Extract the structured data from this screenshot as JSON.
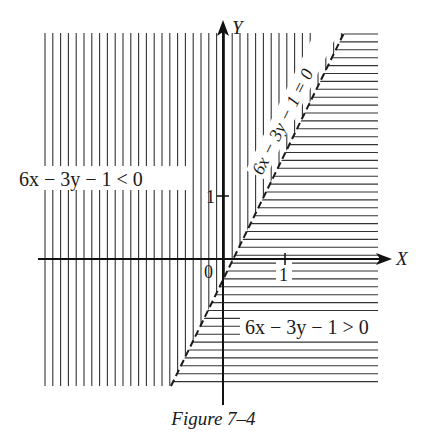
{
  "figure": {
    "caption": "Figure 7–4",
    "line_label": "6x − 3y − 1 = 0",
    "region_less_label": "6x − 3y − 1 < 0",
    "region_greater_label": "6x − 3y − 1 > 0",
    "x_axis_label": "X",
    "y_axis_label": "Y",
    "origin_label": "0",
    "x_tick_label": "1",
    "y_tick_label": "1"
  },
  "chart_data": {
    "type": "region",
    "title": "Figure 7–4",
    "boundary": {
      "equation": "6x − 3y − 1 = 0",
      "form": "y = 2x − 1/3",
      "style": "dashed"
    },
    "regions": [
      {
        "inequality": "6x − 3y − 1 < 0",
        "side": "upper-left",
        "hatch": "vertical"
      },
      {
        "inequality": "6x − 3y − 1 > 0",
        "side": "lower-right",
        "hatch": "horizontal"
      }
    ],
    "xlabel": "X",
    "ylabel": "Y",
    "xticks": [
      1
    ],
    "yticks": [
      1
    ],
    "xlim": [
      -2.9,
      2.5
    ],
    "ylim": [
      -2.1,
      3.6
    ],
    "grid": false
  },
  "colors": {
    "ink": "#1a1a1a",
    "background": "#ffffff"
  }
}
